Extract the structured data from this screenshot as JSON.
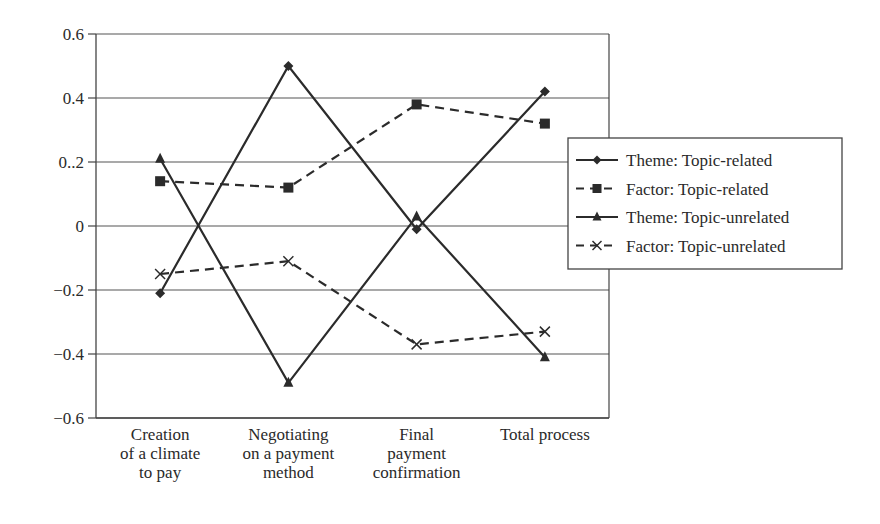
{
  "chart_data": {
    "type": "line",
    "title": "",
    "xlabel": "",
    "ylabel": "",
    "ylim": [
      -0.6,
      0.6
    ],
    "yticks": [
      0.6,
      0.4,
      0.2,
      0,
      -0.2,
      -0.4,
      -0.6
    ],
    "ytick_labels": [
      "0.6",
      "0.4",
      "0..2",
      "0",
      "−0.2",
      "−0.4",
      "−0.6"
    ],
    "grid": "horizontal",
    "categories": [
      [
        "Creation",
        "of a climate",
        "to pay"
      ],
      [
        "Negotiating",
        "on a payment",
        "method"
      ],
      [
        "Final",
        "payment",
        "confirmation"
      ],
      [
        "Total process"
      ]
    ],
    "series": [
      {
        "name": "Theme: Topic-related",
        "marker": "diamond",
        "dash": "solid",
        "values": [
          -0.21,
          0.5,
          -0.01,
          0.42
        ]
      },
      {
        "name": "Factor: Topic-related",
        "marker": "square",
        "dash": "dashed",
        "values": [
          0.14,
          0.12,
          0.38,
          0.32
        ]
      },
      {
        "name": "Theme: Topic-unrelated",
        "marker": "triangle",
        "dash": "solid",
        "values": [
          0.21,
          -0.49,
          0.03,
          -0.41
        ]
      },
      {
        "name": "Factor: Topic-unrelated",
        "marker": "x",
        "dash": "dashed",
        "values": [
          -0.15,
          -0.11,
          -0.37,
          -0.33
        ]
      }
    ],
    "legend": {
      "position": "right"
    },
    "colors": {
      "line": "#2b2b2b",
      "grid": "#555555",
      "axis": "#444444"
    }
  }
}
